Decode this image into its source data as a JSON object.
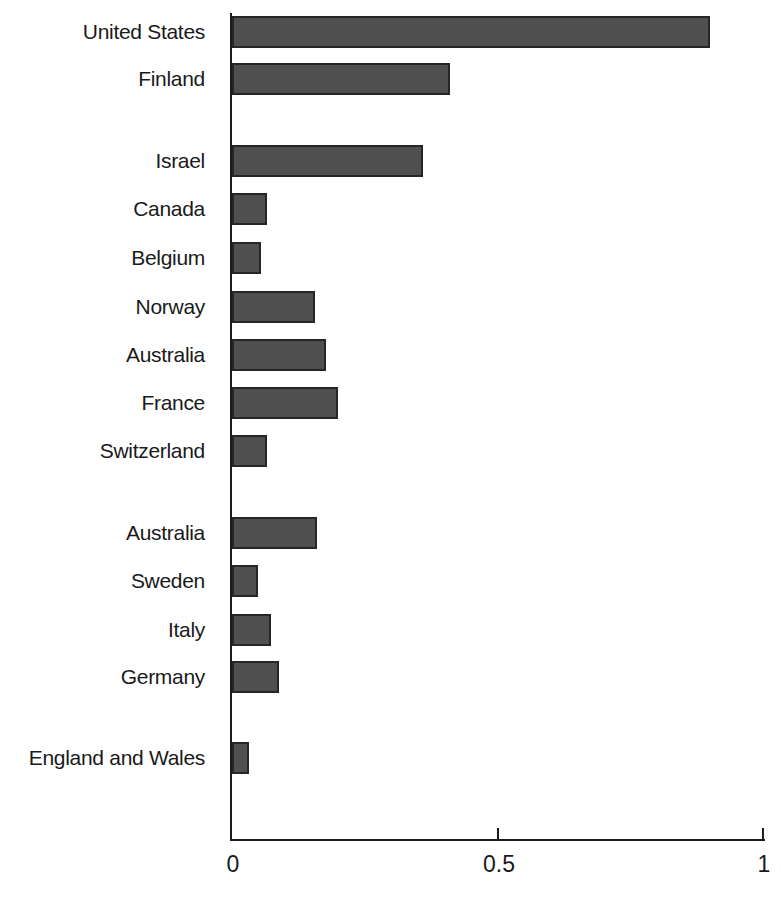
{
  "chart_data": {
    "type": "bar",
    "orientation": "horizontal",
    "title": "",
    "xlabel": "",
    "ylabel": "",
    "categories": [
      "United States",
      "Finland",
      "Israel",
      "Canada",
      "Belgium",
      "Norway",
      "Australia",
      "France",
      "Switzerland",
      "Australia",
      "Sweden",
      "Italy",
      "Germany",
      "England and Wales"
    ],
    "values": [
      0.9,
      0.41,
      0.36,
      0.065,
      0.055,
      0.156,
      0.177,
      0.2,
      0.066,
      0.16,
      0.049,
      0.073,
      0.089,
      0.032
    ],
    "xlim": [
      0,
      1
    ],
    "x_ticks": [
      {
        "value": 0,
        "label": "0",
        "mark": false
      },
      {
        "value": 0.5,
        "label": "0.5",
        "mark": true
      },
      {
        "value": 1,
        "label": "1",
        "mark": true
      }
    ],
    "grid": false,
    "legend": "none",
    "bar_color": "#505050",
    "bar_border_color": "#262626",
    "axis_color": "#1c1c1c",
    "text_color": "#1a1a1a",
    "background_color": "#ffffff",
    "layout": {
      "axis_x_px": 232,
      "axis_right_px": 763,
      "axis_top_px": 13,
      "axis_bottom_px": 840,
      "bar_height_px": 32,
      "row_centers_px": [
        31.5,
        79,
        160.5,
        208.5,
        258,
        306.5,
        355,
        403,
        450.5,
        532.5,
        581,
        629.5,
        676.5,
        758
      ],
      "label_right_px": 205
    }
  }
}
